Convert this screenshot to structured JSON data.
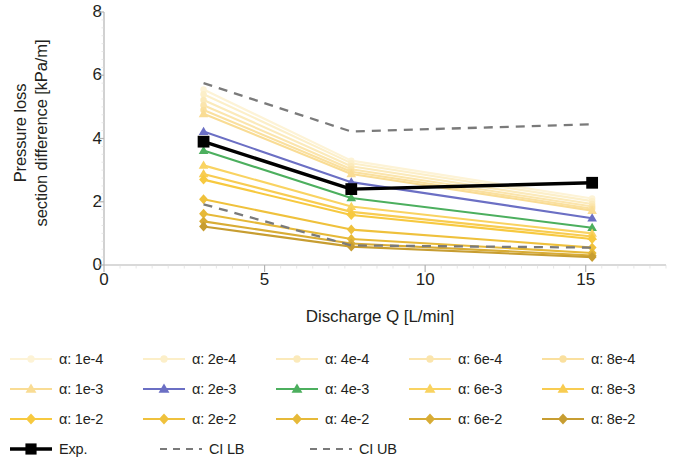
{
  "chart_data": {
    "type": "line",
    "title": "",
    "xlabel": "Discharge Q [L/min]",
    "ylabel_line1": "Pressure loss",
    "ylabel_line2": "section difference [kPa/m]",
    "xlim": [
      0,
      17.5
    ],
    "ylim": [
      0,
      8
    ],
    "xticks": [
      "0",
      "5",
      "10",
      "15"
    ],
    "xtick_values": [
      0,
      5,
      10,
      15
    ],
    "yticks": [
      "0",
      "2",
      "4",
      "6",
      "8"
    ],
    "ytick_values": [
      0,
      2,
      4,
      6,
      8
    ],
    "grid": false,
    "legend_position": "below",
    "x": [
      3.1,
      7.7,
      15.2
    ],
    "series": [
      {
        "name": "α: 1e-4",
        "values": [
          5.55,
          3.3,
          2.1
        ],
        "color": "#fdf3d6",
        "marker": "circle",
        "style": "solid"
      },
      {
        "name": "α: 2e-4",
        "values": [
          5.4,
          3.22,
          2.02
        ],
        "color": "#fcefc9",
        "marker": "circle",
        "style": "solid"
      },
      {
        "name": "α: 4e-4",
        "values": [
          5.22,
          3.12,
          1.93
        ],
        "color": "#fbeabb",
        "marker": "circle",
        "style": "solid"
      },
      {
        "name": "α: 6e-4",
        "values": [
          5.05,
          3.03,
          1.85
        ],
        "color": "#fbe5ad",
        "marker": "circle",
        "style": "solid"
      },
      {
        "name": "α: 8e-4",
        "values": [
          4.9,
          2.95,
          1.78
        ],
        "color": "#fae09f",
        "marker": "circle",
        "style": "solid"
      },
      {
        "name": "α: 1e-3",
        "values": [
          4.78,
          2.88,
          1.72
        ],
        "color": "#f9dc94",
        "marker": "triangle",
        "style": "solid"
      },
      {
        "name": "α: 2e-3",
        "values": [
          4.22,
          2.62,
          1.48
        ],
        "color": "#6b6fc4",
        "marker": "triangle",
        "style": "solid"
      },
      {
        "name": "α: 4e-3",
        "values": [
          3.62,
          2.12,
          1.18
        ],
        "color": "#4caf5e",
        "marker": "triangle",
        "style": "solid"
      },
      {
        "name": "α: 6e-3",
        "values": [
          3.15,
          1.85,
          1.0
        ],
        "color": "#f9d361",
        "marker": "triangle",
        "style": "solid"
      },
      {
        "name": "α: 8e-3",
        "values": [
          2.88,
          1.68,
          0.9
        ],
        "color": "#f8cc51",
        "marker": "triangle",
        "style": "solid"
      },
      {
        "name": "α: 1e-2",
        "values": [
          2.7,
          1.58,
          0.82
        ],
        "color": "#f7c93f",
        "marker": "diamond",
        "style": "solid"
      },
      {
        "name": "α: 2e-2",
        "values": [
          2.08,
          1.12,
          0.55
        ],
        "color": "#efc13c",
        "marker": "diamond",
        "style": "solid"
      },
      {
        "name": "α: 4e-2",
        "values": [
          1.62,
          0.82,
          0.38
        ],
        "color": "#e6b938",
        "marker": "diamond",
        "style": "solid"
      },
      {
        "name": "α: 6e-2",
        "values": [
          1.38,
          0.68,
          0.3
        ],
        "color": "#d8ac35",
        "marker": "diamond",
        "style": "solid"
      },
      {
        "name": "α: 8e-2",
        "values": [
          1.22,
          0.58,
          0.25
        ],
        "color": "#c79d31",
        "marker": "diamond",
        "style": "solid"
      }
    ],
    "reference_series": [
      {
        "name": "Exp.",
        "values": [
          3.9,
          2.4,
          2.6
        ],
        "color": "#000000",
        "marker": "square",
        "style": "solid"
      },
      {
        "name": "CI LB",
        "values": [
          1.92,
          0.62,
          0.55
        ],
        "color": "#7a7a7a",
        "marker": "none",
        "style": "dashed"
      },
      {
        "name": "CI UB",
        "values": [
          5.75,
          4.22,
          4.45
        ],
        "color": "#7a7a7a",
        "marker": "none",
        "style": "dashed"
      }
    ]
  },
  "legend": {
    "rows": [
      [
        "α: 1e-4",
        "α: 2e-4",
        "α: 4e-4",
        "α: 6e-4",
        "α: 8e-4"
      ],
      [
        "α: 1e-3",
        "α: 2e-3",
        "α: 4e-3",
        "α: 6e-3",
        "α: 8e-3"
      ],
      [
        "α: 1e-2",
        "α: 2e-2",
        "α: 4e-2",
        "α: 6e-2",
        "α: 8e-2"
      ],
      [
        "Exp.",
        "CI LB",
        "CI UB"
      ]
    ]
  },
  "colors": {
    "axis": "#b3b3b3",
    "text": "#231f20",
    "experimental": "#000000",
    "confidence_interval": "#7a7a7a",
    "accent_blue": "#6b6fc4",
    "accent_green": "#4caf5e"
  }
}
